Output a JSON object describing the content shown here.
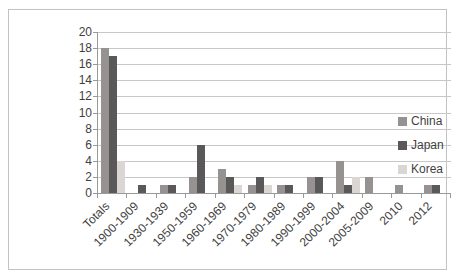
{
  "chart_data": {
    "type": "bar",
    "title": "",
    "xlabel": "",
    "ylabel": "",
    "categories": [
      "Totals",
      "1900-1909",
      "1930-1939",
      "1950-1959",
      "1960-1969",
      "1970-1979",
      "1980-1989",
      "1990-1999",
      "2000-2004",
      "2005-2009",
      "2010",
      "2012"
    ],
    "series": [
      {
        "name": "China",
        "color": "#969292",
        "values": [
          18,
          0,
          1,
          2,
          3,
          1,
          1,
          2,
          4,
          2,
          1,
          1
        ]
      },
      {
        "name": "Japan",
        "color": "#5a5858",
        "values": [
          17,
          1,
          1,
          6,
          2,
          2,
          1,
          2,
          1,
          0,
          0,
          1
        ]
      },
      {
        "name": "Korea",
        "color": "#d9d6d3",
        "values": [
          4,
          0,
          0,
          0,
          1,
          1,
          0,
          0,
          2,
          0,
          0,
          0
        ]
      }
    ],
    "ylim": [
      0,
      20
    ],
    "ytick_step": 2,
    "grid": true,
    "legend_position": "inside-right"
  },
  "colors": {
    "frame_border": "#c3c3c3",
    "gridline": "#c7c7c7",
    "axis": "#9a9a9a",
    "text": "#3f3f3f",
    "background": "#ffffff"
  }
}
